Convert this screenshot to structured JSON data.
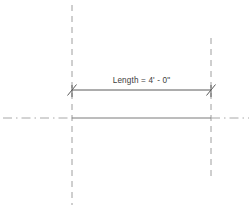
{
  "drawing": {
    "title": "Dimension Annotation",
    "background_color": "#ffffff",
    "dimension": {
      "label": "Length = 4' - 0\"",
      "value_feet": 4,
      "value_inches": 0,
      "line_color": "#5a5a5a",
      "text_color": "#3d3d3d",
      "tick_style": "diagonal-slash",
      "start_x": 72,
      "end_x": 211,
      "y": 90
    },
    "reference_lines": [
      {
        "name": "left-grid-line",
        "orientation": "vertical",
        "style": "dashed",
        "color": "#9e9e9e",
        "x": 72,
        "y_start": 5,
        "y_end": 205
      },
      {
        "name": "right-grid-line",
        "orientation": "vertical",
        "style": "dashed",
        "color": "#9e9e9e",
        "x": 211,
        "y_start": 38,
        "y_end": 180
      }
    ],
    "center_line": {
      "name": "horizontal-center-line",
      "orientation": "horizontal",
      "style": "dash-dot",
      "color": "#a8a8a8",
      "y": 118,
      "x_start": 3,
      "x_end": 249
    },
    "wall_line": {
      "name": "wall-edge-line",
      "orientation": "horizontal",
      "style": "solid",
      "color": "#7a7a7a",
      "y": 118,
      "x_start": 72,
      "x_end": 211
    }
  }
}
